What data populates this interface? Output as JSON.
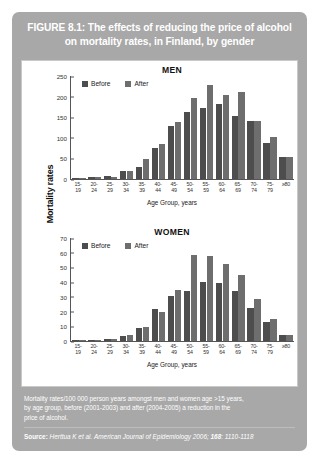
{
  "figure": {
    "title": "FIGURE 8.1: The effects of reducing the price of alcohol on mortality rates, in Finland, by gender",
    "shared_y_axis_label": "Mortality rates",
    "caption_line_1": "Mortality rates/100 000 person years amongst men and women age >15 years,",
    "caption_line_2": "by age group, before (2001-2003) and after (2004-2005) a reduction in the",
    "caption_line_3": "price of alcohol.",
    "source_label": "Source:",
    "source_authors": "Herttua K et al.",
    "source_journal": "American Journal of Epidemiology",
    "source_year": "2006;",
    "source_volume": "168",
    "source_pages": ": 1110-1118"
  },
  "colors": {
    "card_background": "#a8a8a8",
    "panel_background": "#ffffff",
    "before_bar": "#4d4d4d",
    "after_bar": "#6e6e6e",
    "title_text": "#ffffff"
  },
  "chart_data": [
    {
      "type": "bar",
      "title": "MEN",
      "xlabel": "Age Group, years",
      "ylabel": "Mortality rates",
      "ylim": [
        0,
        250
      ],
      "yticks": [
        0,
        50,
        100,
        150,
        200,
        250
      ],
      "grid": false,
      "legend_position": "top-left",
      "categories": [
        "15-\n19",
        "20-\n24",
        "25-\n29",
        "30-\n34",
        "35-\n39",
        "40-\n44",
        "45-\n49",
        "50-\n54",
        "55-\n59",
        "60-\n64",
        "65-\n69",
        "70-\n74",
        "75-\n79",
        "≥80"
      ],
      "series": [
        {
          "name": "Before",
          "values": [
            1,
            4,
            8,
            19,
            30,
            75,
            128,
            162,
            173,
            182,
            153,
            141,
            88,
            54
          ]
        },
        {
          "name": "After",
          "values": [
            2,
            5,
            6,
            20,
            48,
            85,
            139,
            197,
            229,
            203,
            210,
            141,
            101,
            54
          ]
        }
      ]
    },
    {
      "type": "bar",
      "title": "WOMEN",
      "xlabel": "Age Group, years",
      "ylabel": "Mortality rates",
      "ylim": [
        0,
        70
      ],
      "yticks": [
        0,
        10,
        20,
        30,
        40,
        50,
        60,
        70
      ],
      "grid": false,
      "legend_position": "top-left",
      "categories": [
        "15-\n19",
        "20-\n24",
        "25-\n29",
        "30-\n34",
        "35-\n39",
        "40-\n44",
        "45-\n49",
        "50-\n54",
        "55-\n59",
        "60-\n64",
        "65-\n69",
        "70-\n74",
        "75-\n79",
        "≥80"
      ],
      "series": [
        {
          "name": "Before",
          "values": [
            0.4,
            0.8,
            1.4,
            3.6,
            9.0,
            22.0,
            30.5,
            34.0,
            39.8,
            39.2,
            34.2,
            22.6,
            13.2,
            4.0
          ]
        },
        {
          "name": "After",
          "values": [
            0.5,
            1.0,
            1.6,
            4.0,
            9.6,
            19.6,
            34.8,
            58.4,
            57.6,
            52.2,
            45.0,
            28.6,
            14.8,
            4.1
          ]
        }
      ]
    }
  ]
}
